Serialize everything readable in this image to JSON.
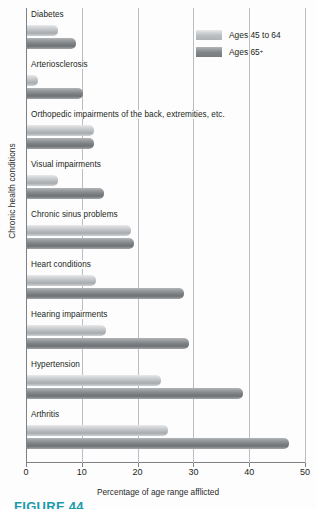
{
  "chart_data": {
    "type": "bar",
    "orientation": "horizontal",
    "title": "",
    "xlabel": "Percentage of age range afflicted",
    "ylabel": "Chronic health conditions",
    "xlim": [
      0,
      50
    ],
    "xticks": [
      0,
      10,
      20,
      30,
      40,
      50
    ],
    "grid": "vertical",
    "legend_position": "top-right",
    "categories": [
      "Diabetes",
      "Arteriosclerosis",
      "Orthopedic impairments of the back, extremities, etc.",
      "Visual impairments",
      "Chronic sinus problems",
      "Heart conditions",
      "Hearing impairments",
      "Hypertension",
      "Arthritis"
    ],
    "series": [
      {
        "name": "Ages 45 to 64",
        "color": "#c2c5c8",
        "values": [
          5.5,
          2.0,
          12.0,
          5.5,
          18.6,
          12.4,
          14.2,
          24.0,
          25.3
        ]
      },
      {
        "name": "Ages 65+",
        "color": "#85898c",
        "values": [
          8.8,
          10.0,
          12.0,
          13.8,
          19.2,
          28.1,
          29.0,
          38.7,
          47.0
        ]
      }
    ]
  },
  "legend": {
    "items": [
      {
        "label": "Ages 45 to 64",
        "label_main": "Ages 45 to 64",
        "sup": ""
      },
      {
        "label": "Ages 65+",
        "label_main": "Ages 65",
        "sup": "+"
      }
    ]
  },
  "caption": {
    "text": "FIGURE 44"
  }
}
